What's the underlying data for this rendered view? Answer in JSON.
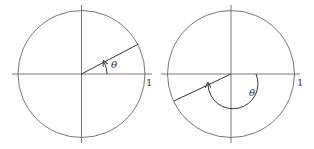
{
  "diagrams": [
    {
      "name": "acute-angle",
      "angle_label": "θ",
      "radius_label": "1",
      "angle_degrees": 30,
      "direction": "counterclockwise"
    },
    {
      "name": "reflex-angle",
      "angle_label": "θ",
      "radius_label": "1",
      "angle_degrees": 210,
      "direction": "clockwise-drawn from positive x-axis through bottom"
    }
  ]
}
